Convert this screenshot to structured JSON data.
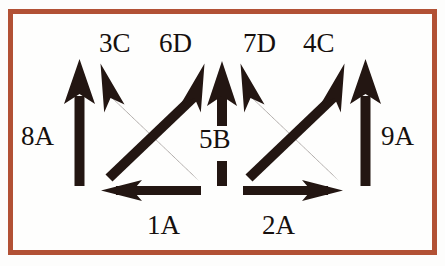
{
  "diagram": {
    "background_color": "#fefefd",
    "border_color": "#b85438",
    "arrow_color": "#231612",
    "text_color": "#16100e",
    "width": 445,
    "height": 266,
    "arrows": [
      {
        "id": "arrow-8A",
        "label": "8A",
        "direction": "up",
        "kind": "vertical",
        "label_position": "left"
      },
      {
        "id": "arrow-3C",
        "label": "3C",
        "direction": "up-left",
        "kind": "diagonal",
        "label_position": "top"
      },
      {
        "id": "arrow-6D",
        "label": "6D",
        "direction": "up-right",
        "kind": "diagonal",
        "label_position": "top"
      },
      {
        "id": "arrow-5B",
        "label": "5B",
        "direction": "up",
        "kind": "vertical-split-shaft",
        "label_position": "center"
      },
      {
        "id": "arrow-7D",
        "label": "7D",
        "direction": "up-left",
        "kind": "diagonal",
        "label_position": "top"
      },
      {
        "id": "arrow-4C",
        "label": "4C",
        "direction": "up-right",
        "kind": "diagonal",
        "label_position": "top"
      },
      {
        "id": "arrow-9A",
        "label": "9A",
        "direction": "up",
        "kind": "vertical",
        "label_position": "right"
      },
      {
        "id": "arrow-1A",
        "label": "1A",
        "direction": "left",
        "kind": "horizontal",
        "label_position": "bottom"
      },
      {
        "id": "arrow-2A",
        "label": "2A",
        "direction": "right",
        "kind": "horizontal",
        "label_position": "bottom"
      }
    ],
    "labels": {
      "a3C": "3C",
      "a6D": "6D",
      "a7D": "7D",
      "a4C": "4C",
      "a8A": "8A",
      "a9A": "9A",
      "a5B": "5B",
      "a1A": "1A",
      "a2A": "2A"
    }
  }
}
